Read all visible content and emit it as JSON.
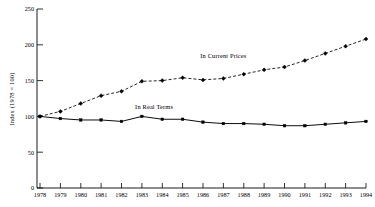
{
  "chart_data": {
    "type": "line",
    "title": "",
    "subtitle": "",
    "xlabel": "",
    "ylabel": "Index (1978 = 100)",
    "x": [
      1978,
      1979,
      1980,
      1981,
      1982,
      1983,
      1984,
      1985,
      1986,
      1987,
      1988,
      1989,
      1990,
      1991,
      1992,
      1993,
      1994
    ],
    "categories": [
      "1978",
      "1979",
      "1980",
      "1981",
      "1982",
      "1983",
      "1984",
      "1985",
      "1986",
      "1987",
      "1988",
      "1989",
      "1990",
      "1991",
      "1992",
      "1993",
      "1994"
    ],
    "xlim": [
      1978,
      1994
    ],
    "ylim": [
      0,
      250
    ],
    "yticks": [
      0,
      50,
      100,
      150,
      200,
      250
    ],
    "ytick_labels": [
      "0",
      "50",
      "100",
      "150",
      "200",
      "250"
    ],
    "grid": false,
    "legend_position": "inline-annotation",
    "series": [
      {
        "name": "In Current Prices",
        "style": "dashed",
        "marker": "diamond",
        "color": "#000000",
        "values": [
          100,
          107,
          118,
          129,
          135,
          149,
          150,
          154,
          151,
          153,
          159,
          165,
          169,
          178,
          188,
          198,
          208
        ]
      },
      {
        "name": "In Real Terms",
        "style": "solid",
        "marker": "square",
        "color": "#000000",
        "values": [
          100,
          97,
          95,
          95,
          93,
          100,
          96,
          96,
          92,
          90,
          90,
          89,
          87,
          87,
          89,
          91,
          93
        ]
      }
    ],
    "annotations": [
      {
        "text": "In Current Prices",
        "x": 1987.0,
        "y": 182
      },
      {
        "text": "In Real Terms",
        "x": 1983.6,
        "y": 110
      }
    ]
  },
  "figure": {
    "background_color": "#ffffff",
    "ink_color": "#000000"
  }
}
